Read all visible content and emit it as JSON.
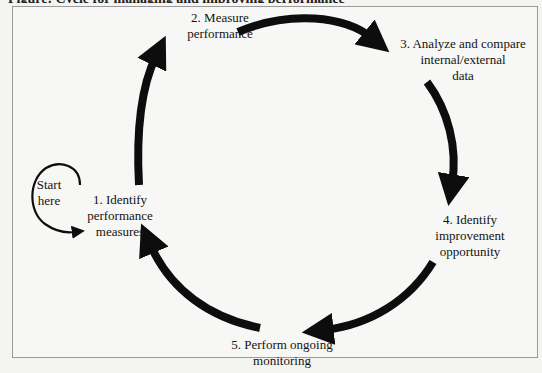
{
  "caption": {
    "text": "Figure: Cycle for managing and improving performance"
  },
  "diagram": {
    "type": "cycle",
    "start_label": [
      "Start",
      "here"
    ],
    "steps": [
      {
        "number": 1,
        "lines": [
          "1. Identify",
          "performance",
          "measures"
        ]
      },
      {
        "number": 2,
        "lines": [
          "2. Measure",
          "performance"
        ]
      },
      {
        "number": 3,
        "lines": [
          "3. Analyze and compare",
          "internal/external",
          "data"
        ]
      },
      {
        "number": 4,
        "lines": [
          "4. Identify",
          "improvement",
          "opportunity"
        ]
      },
      {
        "number": 5,
        "lines": [
          "5. Perform ongoing",
          "monitoring"
        ]
      }
    ],
    "arrows": [
      {
        "from": 1,
        "to": 2
      },
      {
        "from": 2,
        "to": 3
      },
      {
        "from": 3,
        "to": 4
      },
      {
        "from": 4,
        "to": 5
      },
      {
        "from": 5,
        "to": 1
      }
    ],
    "colors": {
      "arrow": "#0d0d0d",
      "text": "#141414",
      "frame_border": "#9a9a9a",
      "background": "#f7f7f5"
    }
  }
}
